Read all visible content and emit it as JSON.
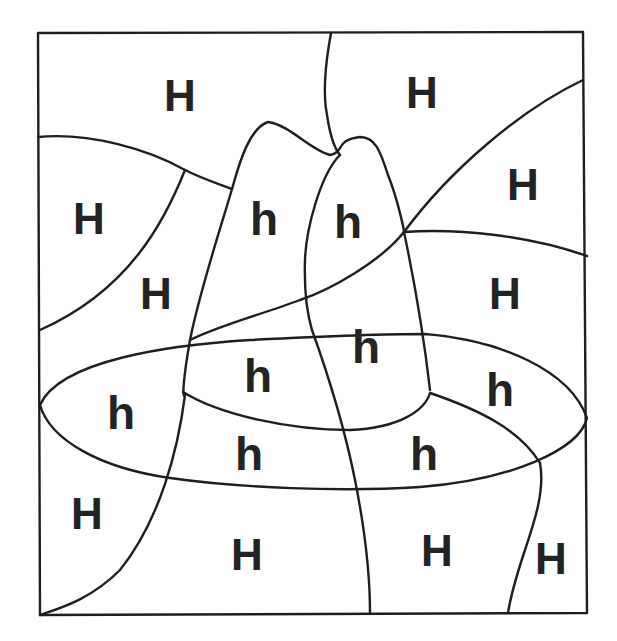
{
  "worksheet": {
    "type": "color-by-letter puzzle",
    "picture": "hat",
    "ink_color": "#1e1e1e",
    "background_color": "#ffffff",
    "labels": [
      {
        "text": "H",
        "x": 180,
        "y": 96
      },
      {
        "text": "H",
        "x": 422,
        "y": 93
      },
      {
        "text": "H",
        "x": 523,
        "y": 185
      },
      {
        "text": "H",
        "x": 89,
        "y": 219
      },
      {
        "text": "h",
        "x": 264,
        "y": 219
      },
      {
        "text": "h",
        "x": 348,
        "y": 222
      },
      {
        "text": "H",
        "x": 156,
        "y": 294
      },
      {
        "text": "H",
        "x": 505,
        "y": 294
      },
      {
        "text": "h",
        "x": 366,
        "y": 347
      },
      {
        "text": "h",
        "x": 258,
        "y": 376
      },
      {
        "text": "h",
        "x": 500,
        "y": 390
      },
      {
        "text": "h",
        "x": 121,
        "y": 413
      },
      {
        "text": "h",
        "x": 249,
        "y": 454
      },
      {
        "text": "h",
        "x": 424,
        "y": 454
      },
      {
        "text": "H",
        "x": 87,
        "y": 514
      },
      {
        "text": "H",
        "x": 247,
        "y": 555
      },
      {
        "text": "H",
        "x": 437,
        "y": 551
      },
      {
        "text": "H",
        "x": 551,
        "y": 559
      }
    ]
  }
}
